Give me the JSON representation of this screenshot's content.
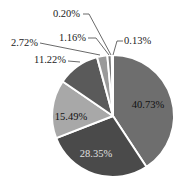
{
  "chart_data": {
    "type": "pie",
    "title": "",
    "start_angle_deg": 0,
    "direction": "clockwise",
    "slices": [
      {
        "label": "40.73%",
        "value": 40.73,
        "color": "#6e6e6e",
        "label_color": "#111111",
        "label_inside": true
      },
      {
        "label": "28.35%",
        "value": 28.35,
        "color": "#4a4a4a",
        "label_color": "#e0e0e0",
        "label_inside": true
      },
      {
        "label": "15.49%",
        "value": 15.49,
        "color": "#a8a8a8",
        "label_color": "#111111",
        "label_inside": true
      },
      {
        "label": "11.22%",
        "value": 11.22,
        "color": "#5a5a5a",
        "label_color": "#222222",
        "label_inside": false
      },
      {
        "label": "2.72%",
        "value": 2.72,
        "color": "#9a9a9a",
        "label_color": "#222222",
        "label_inside": false
      },
      {
        "label": "1.16%",
        "value": 1.16,
        "color": "#7a7a7a",
        "label_color": "#222222",
        "label_inside": false
      },
      {
        "label": "0.20%",
        "value": 0.2,
        "color": "#dddddd",
        "label_color": "#222222",
        "label_inside": false
      },
      {
        "label": "0.13%",
        "value": 0.13,
        "color": "#c8c8c8",
        "label_color": "#222222",
        "label_inside": false
      }
    ],
    "legend": null,
    "grid": false
  },
  "layout": {
    "cx": 113,
    "cy": 116,
    "r": 61,
    "outside_labels": [
      {
        "idx": 3,
        "text_x": 66,
        "text_y": 63,
        "line": [
          [
            68,
            61
          ],
          [
            80,
            62
          ]
        ]
      },
      {
        "idx": 4,
        "text_x": 38,
        "text_y": 46,
        "line": [
          [
            40,
            43
          ],
          [
            100,
            55
          ]
        ]
      },
      {
        "idx": 5,
        "text_x": 86,
        "text_y": 41,
        "line": [
          [
            88,
            38
          ],
          [
            96,
            38
          ],
          [
            109,
            55
          ]
        ]
      },
      {
        "idx": 6,
        "text_x": 80,
        "text_y": 17,
        "line": [
          [
            83,
            14
          ],
          [
            89,
            14
          ],
          [
            111,
            55
          ]
        ]
      },
      {
        "idx": 7,
        "text_x": 124,
        "text_y": 44,
        "line": [
          [
            123,
            41
          ],
          [
            117,
            41
          ],
          [
            113,
            55
          ]
        ]
      }
    ],
    "inside_label_positions": [
      {
        "idx": 0,
        "x": 148,
        "y": 106
      },
      {
        "idx": 1,
        "x": 96,
        "y": 155
      },
      {
        "idx": 2,
        "x": 71,
        "y": 118
      }
    ]
  }
}
